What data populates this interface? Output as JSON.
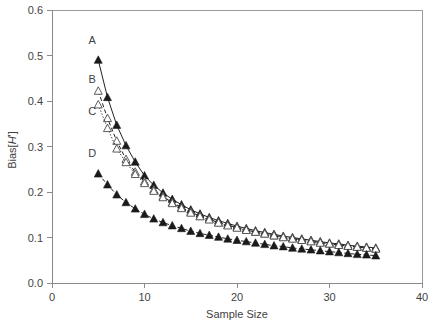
{
  "chart_data": {
    "type": "scatter",
    "title": "",
    "xlabel": "Sample Size",
    "ylabel": "Bias[H']",
    "ylabel_parts": {
      "prefix": "Bias[",
      "italic": "H",
      "suffix": "']"
    },
    "xlim": [
      0,
      40
    ],
    "ylim": [
      0.0,
      0.6
    ],
    "xticks": [
      0,
      10,
      20,
      30,
      40
    ],
    "xtick_labels": [
      "0",
      "10",
      "20",
      "30",
      "40"
    ],
    "yticks": [
      0.0,
      0.1,
      0.2,
      0.3,
      0.4,
      0.5,
      0.6
    ],
    "ytick_labels": [
      "0.0",
      "0.1",
      "0.2",
      "0.3",
      "0.4",
      "0.5",
      "0.6"
    ],
    "grid": false,
    "legend_position": "inline-left",
    "x": [
      5,
      6,
      7,
      8,
      9,
      10,
      11,
      12,
      13,
      14,
      15,
      16,
      17,
      18,
      19,
      20,
      21,
      22,
      23,
      24,
      25,
      26,
      27,
      28,
      29,
      30,
      31,
      32,
      33,
      34,
      35
    ],
    "series": [
      {
        "name": "A",
        "label": "A",
        "marker": "filled-triangle",
        "line": "solid",
        "color": "#1a1a1a",
        "label_xy": [
          5.0,
          0.535
        ],
        "values": [
          0.49,
          0.408,
          0.347,
          0.302,
          0.266,
          0.236,
          0.215,
          0.198,
          0.184,
          0.172,
          0.161,
          0.152,
          0.144,
          0.137,
          0.131,
          0.125,
          0.12,
          0.115,
          0.111,
          0.107,
          0.103,
          0.1,
          0.097,
          0.094,
          0.091,
          0.088,
          0.086,
          0.083,
          0.081,
          0.079,
          0.077
        ]
      },
      {
        "name": "B",
        "label": "B",
        "marker": "open-triangle",
        "line": "dashed",
        "color": "#4a4a4a",
        "label_xy": [
          5.0,
          0.448
        ],
        "values": [
          0.422,
          0.362,
          0.312,
          0.272,
          0.244,
          0.223,
          0.205,
          0.19,
          0.177,
          0.166,
          0.156,
          0.147,
          0.14,
          0.133,
          0.127,
          0.122,
          0.117,
          0.112,
          0.108,
          0.104,
          0.101,
          0.098,
          0.095,
          0.092,
          0.089,
          0.086,
          0.084,
          0.081,
          0.079,
          0.077,
          0.075
        ]
      },
      {
        "name": "C",
        "label": "C",
        "marker": "open-triangle",
        "line": "dotted",
        "color": "#6a6a6a",
        "label_xy": [
          5.0,
          0.378
        ],
        "values": [
          0.392,
          0.34,
          0.295,
          0.265,
          0.239,
          0.219,
          0.202,
          0.188,
          0.175,
          0.164,
          0.154,
          0.146,
          0.139,
          0.132,
          0.126,
          0.121,
          0.116,
          0.112,
          0.108,
          0.104,
          0.1,
          0.097,
          0.094,
          0.091,
          0.088,
          0.086,
          0.083,
          0.081,
          0.079,
          0.077,
          0.075
        ]
      },
      {
        "name": "D",
        "label": "D",
        "marker": "filled-triangle",
        "line": "dashed",
        "color": "#1a1a1a",
        "label_xy": [
          5.0,
          0.285
        ],
        "values": [
          0.24,
          0.216,
          0.194,
          0.177,
          0.163,
          0.151,
          0.141,
          0.133,
          0.126,
          0.12,
          0.114,
          0.109,
          0.105,
          0.101,
          0.097,
          0.094,
          0.091,
          0.088,
          0.085,
          0.082,
          0.08,
          0.077,
          0.075,
          0.073,
          0.071,
          0.069,
          0.067,
          0.065,
          0.063,
          0.062,
          0.06
        ]
      }
    ]
  }
}
